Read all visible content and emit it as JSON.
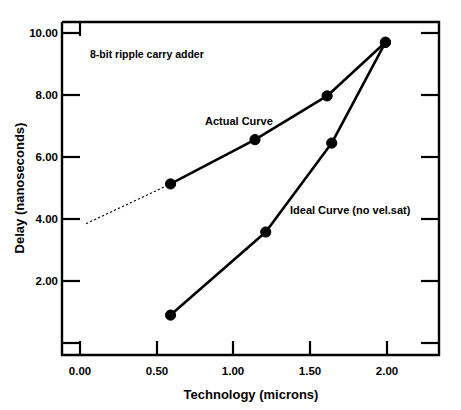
{
  "chart_data": {
    "type": "line",
    "title": "",
    "xlabel": "Technology (microns)",
    "ylabel": "Delay (nanoseconds)",
    "xlim": [
      0.0,
      2.35
    ],
    "ylim": [
      0.0,
      10.6
    ],
    "xticks": [
      0.0,
      0.5,
      1.0,
      1.5,
      2.0
    ],
    "xtick_labels": [
      "0.00",
      "0.50",
      "1.00",
      "1.50",
      "2.00"
    ],
    "yticks": [
      2.0,
      4.0,
      6.0,
      8.0,
      10.0
    ],
    "ytick_labels": [
      "2.00",
      "4.00",
      "6.00",
      "8.00",
      "10.00"
    ],
    "grid": false,
    "legend_position": "inline-annotations",
    "annotations": [
      {
        "name": "chart-caption",
        "text": "8-bit ripple carry adder",
        "x": 0.16,
        "y": 9.35
      }
    ],
    "series": [
      {
        "name": "Actual Curve",
        "label": "Actual Curve",
        "label_x": 0.8,
        "label_y": 7.0,
        "marker": "circle",
        "x": [
          0.59,
          1.14,
          1.61,
          1.99
        ],
        "y": [
          5.13,
          6.56,
          7.97,
          9.7
        ],
        "extrapolation": {
          "style": "dotted",
          "x": [
            0.04,
            0.59
          ],
          "y": [
            3.85,
            5.13
          ]
        }
      },
      {
        "name": "Ideal Curve (no vel.sat)",
        "label": "Ideal Curve (no vel.sat)",
        "label_x": 1.26,
        "label_y": 4.3,
        "marker": "circle",
        "x": [
          0.59,
          1.21,
          1.64,
          1.99
        ],
        "y": [
          0.9,
          3.58,
          6.45,
          9.7
        ]
      }
    ]
  },
  "colors": {
    "background": "#ffffff",
    "foreground": "#000000",
    "axis": "#000000",
    "series": "#000000"
  }
}
